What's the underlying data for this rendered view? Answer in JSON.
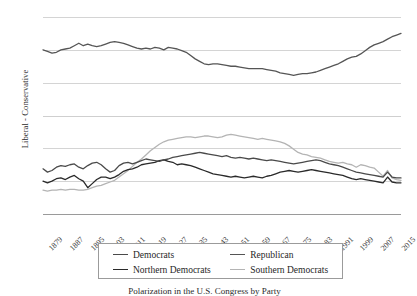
{
  "chart_data": {
    "type": "line",
    "title": "",
    "subtitle": "",
    "caption": "Polarization in the U.S. Congress by Party",
    "xlabel": "",
    "ylabel": "Liberal - Conservative",
    "grid": true,
    "legend_position": "bottom-center",
    "ylim": [
      -0.6,
      0.6
    ],
    "ytick_labels": [
      "0.6",
      "0.4",
      "0.2",
      "0",
      "-0.2",
      "-0.4",
      "-0.6"
    ],
    "ytick_values": [
      0.6,
      0.4,
      0.2,
      0,
      -0.2,
      -0.4,
      -0.6
    ],
    "xtick_labels": [
      "1879",
      "1887",
      "1895",
      "1903",
      "1911",
      "1919",
      "1927",
      "1935",
      "1943",
      "1951",
      "1959",
      "1967",
      "1975",
      "1983",
      "1991",
      "1999",
      "2007",
      "2015"
    ],
    "x_start": 1879,
    "x_end": 2017,
    "x_step_years": 2,
    "series": [
      {
        "name": "Republican",
        "color": "#555555",
        "width": 1.3,
        "values": [
          0.4,
          0.39,
          0.38,
          0.385,
          0.4,
          0.405,
          0.41,
          0.425,
          0.44,
          0.425,
          0.435,
          0.425,
          0.42,
          0.425,
          0.435,
          0.445,
          0.45,
          0.445,
          0.44,
          0.43,
          0.42,
          0.41,
          0.405,
          0.41,
          0.405,
          0.415,
          0.41,
          0.4,
          0.415,
          0.41,
          0.405,
          0.395,
          0.385,
          0.365,
          0.345,
          0.33,
          0.315,
          0.31,
          0.315,
          0.315,
          0.31,
          0.305,
          0.3,
          0.3,
          0.295,
          0.29,
          0.285,
          0.285,
          0.285,
          0.285,
          0.28,
          0.275,
          0.27,
          0.26,
          0.255,
          0.25,
          0.245,
          0.25,
          0.255,
          0.255,
          0.26,
          0.265,
          0.275,
          0.285,
          0.295,
          0.305,
          0.315,
          0.33,
          0.345,
          0.355,
          0.36,
          0.375,
          0.395,
          0.415,
          0.43,
          0.44,
          0.45,
          0.465,
          0.48,
          0.49,
          0.5
        ]
      },
      {
        "name": "Democrats",
        "color": "#4a4a4a",
        "width": 1.3,
        "values": [
          -0.325,
          -0.345,
          -0.335,
          -0.315,
          -0.305,
          -0.31,
          -0.3,
          -0.295,
          -0.315,
          -0.325,
          -0.305,
          -0.29,
          -0.285,
          -0.3,
          -0.325,
          -0.345,
          -0.335,
          -0.305,
          -0.29,
          -0.285,
          -0.295,
          -0.285,
          -0.275,
          -0.265,
          -0.27,
          -0.275,
          -0.28,
          -0.27,
          -0.265,
          -0.255,
          -0.25,
          -0.245,
          -0.24,
          -0.235,
          -0.23,
          -0.225,
          -0.23,
          -0.235,
          -0.24,
          -0.245,
          -0.25,
          -0.245,
          -0.255,
          -0.26,
          -0.255,
          -0.26,
          -0.265,
          -0.26,
          -0.265,
          -0.27,
          -0.275,
          -0.27,
          -0.275,
          -0.28,
          -0.285,
          -0.29,
          -0.295,
          -0.29,
          -0.285,
          -0.28,
          -0.275,
          -0.27,
          -0.275,
          -0.285,
          -0.295,
          -0.3,
          -0.305,
          -0.315,
          -0.325,
          -0.335,
          -0.345,
          -0.35,
          -0.355,
          -0.36,
          -0.365,
          -0.37,
          -0.375,
          -0.345,
          -0.375,
          -0.38,
          -0.38
        ]
      },
      {
        "name": "Northern Democrats",
        "color": "#2a2a2a",
        "width": 1.3,
        "values": [
          -0.4,
          -0.41,
          -0.4,
          -0.385,
          -0.38,
          -0.39,
          -0.375,
          -0.365,
          -0.385,
          -0.4,
          -0.44,
          -0.415,
          -0.39,
          -0.375,
          -0.375,
          -0.385,
          -0.375,
          -0.36,
          -0.34,
          -0.33,
          -0.325,
          -0.315,
          -0.3,
          -0.295,
          -0.29,
          -0.285,
          -0.275,
          -0.27,
          -0.28,
          -0.285,
          -0.3,
          -0.295,
          -0.3,
          -0.305,
          -0.315,
          -0.325,
          -0.335,
          -0.345,
          -0.355,
          -0.36,
          -0.365,
          -0.37,
          -0.375,
          -0.37,
          -0.375,
          -0.38,
          -0.375,
          -0.37,
          -0.375,
          -0.38,
          -0.37,
          -0.365,
          -0.355,
          -0.345,
          -0.34,
          -0.335,
          -0.34,
          -0.345,
          -0.34,
          -0.335,
          -0.33,
          -0.335,
          -0.34,
          -0.345,
          -0.35,
          -0.355,
          -0.36,
          -0.365,
          -0.375,
          -0.385,
          -0.39,
          -0.385,
          -0.39,
          -0.395,
          -0.4,
          -0.405,
          -0.41,
          -0.375,
          -0.405,
          -0.41,
          -0.41
        ]
      },
      {
        "name": "Southern Democrats",
        "color": "#b4b4b4",
        "width": 1.3,
        "values": [
          -0.455,
          -0.46,
          -0.455,
          -0.455,
          -0.45,
          -0.455,
          -0.45,
          -0.45,
          -0.455,
          -0.455,
          -0.45,
          -0.44,
          -0.43,
          -0.425,
          -0.415,
          -0.405,
          -0.395,
          -0.375,
          -0.355,
          -0.335,
          -0.31,
          -0.285,
          -0.265,
          -0.24,
          -0.215,
          -0.195,
          -0.175,
          -0.16,
          -0.15,
          -0.145,
          -0.14,
          -0.135,
          -0.13,
          -0.13,
          -0.135,
          -0.13,
          -0.125,
          -0.125,
          -0.13,
          -0.135,
          -0.13,
          -0.12,
          -0.115,
          -0.12,
          -0.125,
          -0.13,
          -0.135,
          -0.14,
          -0.145,
          -0.14,
          -0.145,
          -0.15,
          -0.155,
          -0.16,
          -0.17,
          -0.185,
          -0.205,
          -0.225,
          -0.235,
          -0.24,
          -0.25,
          -0.255,
          -0.26,
          -0.27,
          -0.28,
          -0.285,
          -0.29,
          -0.285,
          -0.295,
          -0.3,
          -0.315,
          -0.3,
          -0.305,
          -0.315,
          -0.32,
          -0.345,
          -0.37,
          -0.335,
          -0.38,
          -0.39,
          -0.395
        ]
      }
    ]
  },
  "legend": {
    "items": [
      {
        "label": "Democrats",
        "color": "#4a4a4a"
      },
      {
        "label": "Republican",
        "color": "#555555"
      },
      {
        "label": "Northern Democrats",
        "color": "#2a2a2a"
      },
      {
        "label": "Southern Democrats",
        "color": "#b4b4b4"
      }
    ]
  }
}
